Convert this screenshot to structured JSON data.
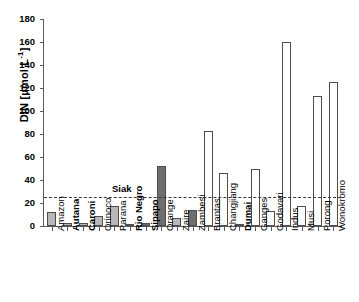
{
  "chart_data": {
    "type": "bar",
    "title": "",
    "xlabel": "",
    "ylabel": "DIN [µmol L-1]",
    "ylabel_base": "DIN [µmol L",
    "ylabel_sup": "-1",
    "ylabel_tail": "]",
    "ylim": [
      0,
      180
    ],
    "yticks": [
      0,
      20,
      40,
      60,
      80,
      100,
      120,
      140,
      160,
      180
    ],
    "grid": false,
    "legend": "none",
    "categories": [
      "Amazon",
      "Autana",
      "Caroni",
      "Orinoco",
      "Parana",
      "Rio Negro",
      "Sipapo",
      "Orange",
      "Zaire",
      "Zambesi",
      "Brantas",
      "Changjiang",
      "Dumai",
      "Ganges",
      "Godavari",
      "Indus",
      "Musi",
      "Porong",
      "Wonokromo"
    ],
    "values": [
      12,
      3,
      3,
      9,
      17,
      2,
      3,
      52,
      7,
      14,
      83,
      46,
      1,
      50,
      13,
      160,
      17,
      113,
      125
    ],
    "bar_styles": [
      "light",
      "light",
      "light",
      "light",
      "light",
      "light",
      "dark",
      "dark",
      "light",
      "dark",
      "open",
      "open",
      "open",
      "open",
      "open",
      "open",
      "open",
      "open",
      "open"
    ],
    "bold_labels": [
      "Autana",
      "Caroni",
      "Rio Negro",
      "Sipapo",
      "Dumai"
    ],
    "annotations": [
      {
        "name": "Siak",
        "label": "Siak",
        "value": 25,
        "style": "dashed-horizontal-line"
      }
    ],
    "colors": {
      "fill_light": "#b8b8b8",
      "fill_dark": "#6e6e6e",
      "fill_open": "#ffffff",
      "bar_outline": "#4d4d4d",
      "axis": "#5a5a5a",
      "reference_line": "#3a3a3a",
      "background": "#ffffff"
    }
  }
}
